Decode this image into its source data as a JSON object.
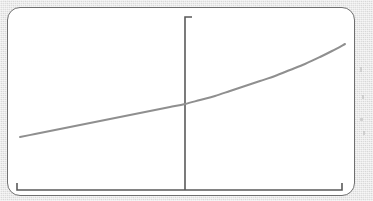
{
  "figure": {
    "background_color": "#dddddd",
    "card_color": "#ffffff",
    "card_border_color": "#6f6f6f",
    "axis_color": "#5a5a5a",
    "curve_color": "#8f8f8f"
  },
  "chart_data": {
    "type": "line",
    "title": "",
    "subtitle": "",
    "xlabel": "",
    "ylabel": "",
    "legend": [],
    "annotations": [],
    "grid": false,
    "legend_position": "none",
    "xlim": [
      0,
      100
    ],
    "ylim": [
      0,
      100
    ],
    "xticks": [],
    "yticks": [],
    "xticklabels": [],
    "yticklabels": [],
    "axes": {
      "x_axis": {
        "name": "horizontal-axis",
        "x_start_px": 17,
        "x_end_px": 342,
        "y_px": 190,
        "end_caps": "upward-ticks-both-ends",
        "cap_length_px": 7
      },
      "y_axis": {
        "name": "vertical-axis",
        "x_px": 185,
        "y_start_px": 17,
        "y_end_px": 190,
        "end_caps": "rightward-tick-top",
        "cap_length_px": 7
      }
    },
    "series": [
      {
        "name": "exponential-curve",
        "color": "#8f8f8f",
        "width_px": 2,
        "x": [
          20,
          35,
          50,
          65,
          80,
          95,
          110,
          125,
          140,
          155,
          170,
          185,
          200,
          215,
          230,
          245,
          260,
          275,
          290,
          305,
          320,
          332,
          345
        ],
        "y": [
          137,
          134,
          131,
          128,
          125,
          122,
          119,
          116,
          113,
          110,
          107,
          104,
          100,
          96,
          91,
          86,
          81,
          76,
          70,
          64,
          57,
          51,
          44
        ]
      }
    ]
  },
  "marks": {
    "speckles": [
      {
        "left": 360,
        "top": 67,
        "w": 2,
        "h": 5
      },
      {
        "left": 362,
        "top": 95,
        "w": 2,
        "h": 4
      },
      {
        "left": 360,
        "top": 118,
        "w": 3,
        "h": 3
      },
      {
        "left": 363,
        "top": 131,
        "w": 2,
        "h": 4
      }
    ]
  }
}
